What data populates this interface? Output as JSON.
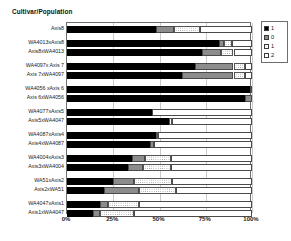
{
  "chart_data": {
    "type": "bar",
    "orientation": "horizontal",
    "stacked": true,
    "stack_mode": "percent",
    "title": "",
    "xlabel": "",
    "ylabel": "Cultivar/Population",
    "axis_title": "Cultivar/Population",
    "xlim": [
      0,
      100
    ],
    "xticks": [
      0,
      25,
      50,
      75,
      100
    ],
    "xticklabels": [
      "0%",
      "25%",
      "50%",
      "75%",
      "100%"
    ],
    "grid": true,
    "legend_position": "right",
    "legend": [
      {
        "label": "1",
        "swatch": "black"
      },
      {
        "label": "0",
        "swatch": "gray"
      },
      {
        "label": "1",
        "swatch": "dotted"
      },
      {
        "label": "2",
        "swatch": "white"
      }
    ],
    "series": [
      {
        "name": "1",
        "swatch": "black"
      },
      {
        "name": "0",
        "swatch": "gray"
      },
      {
        "name": "1",
        "swatch": "dotted"
      },
      {
        "name": "2",
        "swatch": "white"
      }
    ],
    "categories": [
      "Axis8",
      "WA4013xAxis8",
      "Axis8xWA4013",
      "WA4097x Axis 7",
      "Axis 7xWA4097",
      "WA4056 xAxis 6",
      "Axis 6xWA4056",
      "WA4077xAxis5",
      "Axis5xWA4047",
      "WA4087xAxis4",
      "Axis4xWA4087",
      "WA4004xAxis3",
      "Axis3xWA4004",
      "WA51xAxis2",
      "Axis2xWA51",
      "WA4047xAxis1",
      "Axis1xWA4047"
    ],
    "rows": [
      {
        "category": "Axis8",
        "group": 0,
        "values": [
          48,
          10,
          14,
          28
        ]
      },
      {
        "category": "WA4013xAxis8",
        "group": 1,
        "values": [
          82,
          3,
          4,
          11
        ]
      },
      {
        "category": "Axis8xWA4013",
        "group": 1,
        "values": [
          73,
          10,
          7,
          10
        ]
      },
      {
        "category": "WA4097x Axis 7",
        "group": 2,
        "values": [
          69,
          21,
          6,
          4
        ]
      },
      {
        "category": "Axis 7xWA4097",
        "group": 2,
        "values": [
          62,
          28,
          6,
          4
        ]
      },
      {
        "category": "WA4056 xAxis 6",
        "group": 3,
        "values": [
          99,
          1,
          0,
          0
        ]
      },
      {
        "category": "Axis 6xWA4056",
        "group": 3,
        "values": [
          96,
          4,
          0,
          0
        ]
      },
      {
        "category": "WA4077xAxis5",
        "group": 4,
        "values": [
          46,
          0,
          0,
          54
        ]
      },
      {
        "category": "Axis5xWA4047",
        "group": 4,
        "values": [
          55,
          0,
          2,
          43
        ]
      },
      {
        "category": "WA4087xAxis4",
        "group": 5,
        "values": [
          48,
          0,
          1,
          51
        ]
      },
      {
        "category": "Axis4xWA4087",
        "group": 5,
        "values": [
          45,
          2,
          0,
          53
        ]
      },
      {
        "category": "WA4004xAxis3",
        "group": 6,
        "values": [
          35,
          7,
          14,
          44
        ]
      },
      {
        "category": "Axis3xWA4004",
        "group": 6,
        "values": [
          33,
          8,
          15,
          44
        ]
      },
      {
        "category": "WA51xAxis2",
        "group": 7,
        "values": [
          25,
          11,
          21,
          43
        ]
      },
      {
        "category": "Axis2xWA51",
        "group": 7,
        "values": [
          20,
          19,
          20,
          41
        ]
      },
      {
        "category": "WA4047xAxis1",
        "group": 8,
        "values": [
          18,
          4,
          17,
          61
        ]
      },
      {
        "category": "Axis1xWA4047",
        "group": 8,
        "values": [
          14,
          4,
          18,
          64
        ]
      }
    ]
  }
}
